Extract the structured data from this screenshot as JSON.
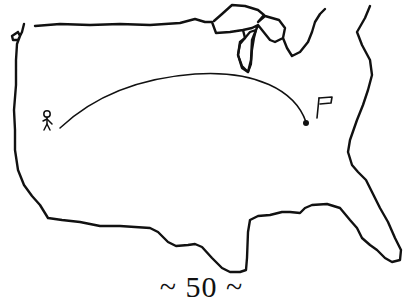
{
  "figure": {
    "caption": "~ 50 ~",
    "ink_color": "#111111",
    "background_color": "#ffffff"
  },
  "elements": {
    "start_marker": "stick-figure",
    "path": "arc",
    "end_marker": "dot",
    "goal_marker": "flag"
  }
}
